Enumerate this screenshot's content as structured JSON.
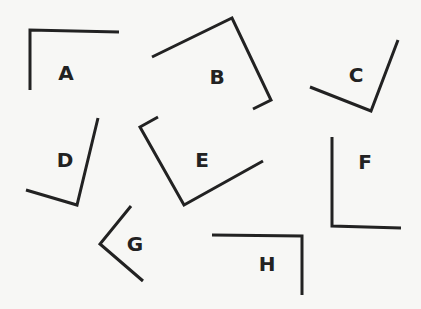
{
  "canvas": {
    "width": 421,
    "height": 309,
    "background": "#f7f7f5",
    "stroke_color": "#222222"
  },
  "shapes": [
    {
      "label": "A",
      "points": "30,90 30,30 119,32",
      "label_pos": [
        66,
        80
      ]
    },
    {
      "label": "B",
      "points": "152,57 232,18 271,100 253,109",
      "label_pos": [
        217,
        84
      ]
    },
    {
      "label": "C",
      "points": "310,87 371,111 398,40",
      "label_pos": [
        356,
        82
      ]
    },
    {
      "label": "D",
      "points": "26,190 77,205 98,118",
      "label_pos": [
        65,
        167
      ]
    },
    {
      "label": "E",
      "points": "158,117 140,127 184,205 263,161",
      "label_pos": [
        202,
        167
      ]
    },
    {
      "label": "F",
      "points": "332,137 332,226 401,228",
      "label_pos": [
        365,
        169
      ]
    },
    {
      "label": "G",
      "points": "131,206 100,244 143,281",
      "label_pos": [
        135,
        251
      ]
    },
    {
      "label": "H",
      "points": "212,235 302,236 302,295",
      "label_pos": [
        267,
        271
      ]
    }
  ]
}
